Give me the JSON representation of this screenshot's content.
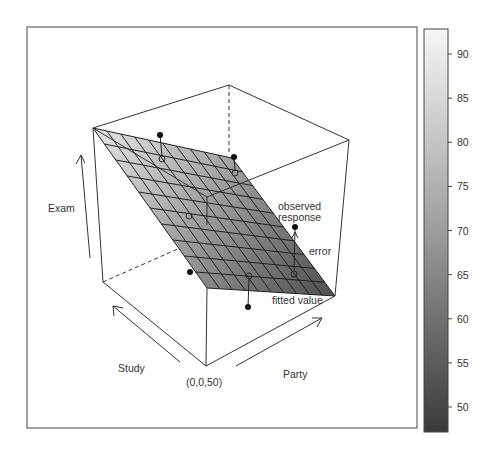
{
  "chart_data": {
    "type": "scatter",
    "subtype": "3d-regression-plane",
    "title": "",
    "axes": {
      "x": {
        "label": "Study"
      },
      "y": {
        "label": "Party"
      },
      "z": {
        "label": "Exam"
      },
      "origin_label": "(0,0,50)"
    },
    "annotations": {
      "observed_line1": "observed",
      "observed_line2": "response",
      "error": "error",
      "fitted": "fitted value"
    },
    "colorbar": {
      "min": 47,
      "max": 93,
      "ticks": [
        50,
        55,
        60,
        65,
        70,
        75,
        80,
        85,
        90
      ],
      "tick_labels": [
        "50",
        "55",
        "60",
        "65",
        "70",
        "75",
        "80",
        "85",
        "90"
      ],
      "color_low": "#3a3a3a",
      "color_high": "#f4f4f4"
    },
    "surface": {
      "grid_divisions": 10,
      "corners_z": {
        "back_left": 92,
        "back_right": 72,
        "front_right": 48,
        "front_left": 66
      }
    },
    "points": [
      {
        "label": "p1",
        "observed_above": true
      },
      {
        "label": "p2",
        "observed_above": true
      },
      {
        "label": "p3",
        "observed_above": false
      },
      {
        "label": "p4",
        "observed_above": false
      },
      {
        "label": "p5",
        "observed_above": true
      },
      {
        "label": "p6",
        "observed_above": false
      }
    ],
    "grid": false,
    "legend": "colorbar-right"
  }
}
